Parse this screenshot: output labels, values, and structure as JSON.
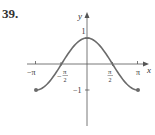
{
  "problem": {
    "number": "39."
  },
  "axes": {
    "x_label": "x",
    "y_label": "y",
    "x_ticks": [
      {
        "label": "−π",
        "value": -3.14159
      },
      {
        "label_num": "π",
        "label_den": "2",
        "label_sign": "−",
        "value": -1.5708
      },
      {
        "label_num": "π",
        "label_den": "2",
        "label_sign": "",
        "value": 1.5708
      },
      {
        "label": "π",
        "value": 3.14159
      }
    ],
    "y_ticks": [
      {
        "label": "1",
        "value": 1
      },
      {
        "label": "−1",
        "value": -1
      }
    ]
  },
  "colors": {
    "curve": "#6b6b6b",
    "axis": "#555555",
    "text": "#333333",
    "background": "#ffffff"
  },
  "chart_data": {
    "type": "line",
    "title": "39.",
    "xlabel": "x",
    "ylabel": "y",
    "function": "y = cos(x), -π ≤ x ≤ π",
    "xlim": [
      -3.14159,
      3.14159
    ],
    "ylim": [
      -1,
      1
    ],
    "grid": false,
    "legend": "none",
    "x": [
      -3.14159,
      -2.35619,
      -1.5708,
      -0.7854,
      0,
      0.7854,
      1.5708,
      2.35619,
      3.14159
    ],
    "series": [
      {
        "name": "cos(x)",
        "values": [
          -1,
          -0.7071,
          0,
          0.7071,
          1,
          0.7071,
          0,
          -0.7071,
          -1
        ]
      }
    ],
    "endpoints": [
      {
        "x": -3.14159,
        "y": -1,
        "style": "closed"
      },
      {
        "x": 3.14159,
        "y": -1,
        "style": "closed"
      }
    ],
    "x_tick_labels": [
      "−π",
      "−π/2",
      "π/2",
      "π"
    ],
    "y_tick_labels": [
      "1",
      "−1"
    ]
  }
}
